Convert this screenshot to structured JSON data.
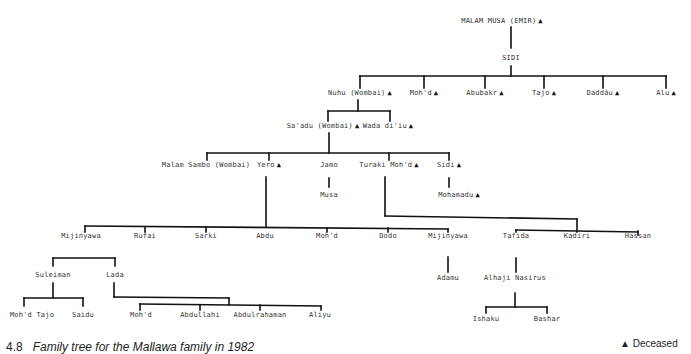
{
  "title": "Family tree for the Mallawa family in 1982",
  "figure_number": "4.8",
  "legend": {
    "symbol": "▲",
    "label": "Deceased"
  },
  "nodes": [
    {
      "id": "malam_musa",
      "name": "MALAM MUSA (EMIR)",
      "deceased": true,
      "x": 502,
      "y": 22
    },
    {
      "id": "sidi_root",
      "name": "SIDI",
      "deceased": false,
      "x": 511,
      "y": 59
    },
    {
      "id": "nuhu",
      "name": "Nuhu (Wombai)",
      "deceased": true,
      "x": 360,
      "y": 94
    },
    {
      "id": "mohd1",
      "name": "Moh'd",
      "deceased": true,
      "x": 424,
      "y": 94
    },
    {
      "id": "abubakr",
      "name": "Abubakr",
      "deceased": true,
      "x": 485,
      "y": 94
    },
    {
      "id": "tajo",
      "name": "Tajo",
      "deceased": true,
      "x": 544,
      "y": 94
    },
    {
      "id": "daddau",
      "name": "Daddâu",
      "deceased": true,
      "x": 603,
      "y": 94
    },
    {
      "id": "alu",
      "name": "Alu",
      "deceased": true,
      "x": 666,
      "y": 94
    },
    {
      "id": "saadu",
      "name": "Sa'adu (Wombai)",
      "deceased": true,
      "x": 323,
      "y": 127
    },
    {
      "id": "wada",
      "name": "Wada di'iu",
      "deceased": true,
      "x": 388,
      "y": 127
    },
    {
      "id": "malam_sambo",
      "name": "Malam Sambo (Wombai)",
      "deceased": false,
      "x": 206,
      "y": 166
    },
    {
      "id": "yero",
      "name": "Yero",
      "deceased": true,
      "x": 269,
      "y": 166
    },
    {
      "id": "jamo",
      "name": "Jamo",
      "deceased": false,
      "x": 329,
      "y": 166
    },
    {
      "id": "turaki",
      "name": "Turaki Moh'd",
      "deceased": true,
      "x": 389,
      "y": 166
    },
    {
      "id": "sidi2",
      "name": "Sidi",
      "deceased": true,
      "x": 449,
      "y": 166
    },
    {
      "id": "musa",
      "name": "Musa",
      "deceased": false,
      "x": 329,
      "y": 196
    },
    {
      "id": "mohamadu",
      "name": "Mohamadu",
      "deceased": true,
      "x": 459,
      "y": 196
    },
    {
      "id": "mijinyawa1",
      "name": "Mijinyawa",
      "deceased": false,
      "x": 81,
      "y": 237
    },
    {
      "id": "rufai",
      "name": "Rufai",
      "deceased": false,
      "x": 145,
      "y": 237
    },
    {
      "id": "sarki",
      "name": "Sarki",
      "deceased": false,
      "x": 206,
      "y": 237
    },
    {
      "id": "abdu",
      "name": "Abdu",
      "deceased": false,
      "x": 265,
      "y": 237
    },
    {
      "id": "mohd2",
      "name": "Moh'd",
      "deceased": false,
      "x": 327,
      "y": 237
    },
    {
      "id": "dodo",
      "name": "Dodo",
      "deceased": false,
      "x": 388,
      "y": 237
    },
    {
      "id": "mijinyawa2",
      "name": "Mijinyawa",
      "deceased": false,
      "x": 448,
      "y": 237
    },
    {
      "id": "tafida",
      "name": "Tafida",
      "deceased": false,
      "x": 516,
      "y": 237
    },
    {
      "id": "kadiri",
      "name": "Kadiri",
      "deceased": false,
      "x": 577,
      "y": 237
    },
    {
      "id": "hassan",
      "name": "Hassan",
      "deceased": false,
      "x": 638,
      "y": 237
    },
    {
      "id": "suleiman",
      "name": "Suleiman",
      "deceased": false,
      "x": 53,
      "y": 276
    },
    {
      "id": "lada",
      "name": "Lada",
      "deceased": false,
      "x": 115,
      "y": 276
    },
    {
      "id": "adamu",
      "name": "Adamu",
      "deceased": false,
      "x": 448,
      "y": 279
    },
    {
      "id": "alhaji_nasirus",
      "name": "Alhaji Nasirus",
      "deceased": false,
      "x": 515,
      "y": 279
    },
    {
      "id": "mohd_tajo",
      "name": "Moh'd Tajo",
      "deceased": false,
      "x": 32,
      "y": 316
    },
    {
      "id": "saidu",
      "name": "Saidu",
      "deceased": false,
      "x": 83,
      "y": 316
    },
    {
      "id": "mohd3",
      "name": "Moh'd",
      "deceased": false,
      "x": 141,
      "y": 316
    },
    {
      "id": "abdullahi",
      "name": "Abdullahi",
      "deceased": false,
      "x": 200,
      "y": 316
    },
    {
      "id": "abdulrahaman",
      "name": "Abdulrahaman",
      "deceased": false,
      "x": 260,
      "y": 316
    },
    {
      "id": "aliyu",
      "name": "Aliyu",
      "deceased": false,
      "x": 320,
      "y": 316
    },
    {
      "id": "ishaku",
      "name": "Ishaku",
      "deceased": false,
      "x": 486,
      "y": 320
    },
    {
      "id": "bashar",
      "name": "Bashar",
      "deceased": false,
      "x": 547,
      "y": 320
    }
  ],
  "lines": [
    [
      511,
      27,
      511,
      48
    ],
    [
      511,
      66,
      511,
      76
    ],
    [
      360,
      76,
      666,
      76
    ],
    [
      360,
      76,
      360,
      88
    ],
    [
      424,
      76,
      424,
      88
    ],
    [
      485,
      76,
      485,
      88
    ],
    [
      544,
      76,
      544,
      88
    ],
    [
      603,
      76,
      603,
      88
    ],
    [
      666,
      76,
      666,
      88
    ],
    [
      358,
      100,
      358,
      111
    ],
    [
      328,
      111,
      390,
      111
    ],
    [
      328,
      111,
      328,
      121
    ],
    [
      390,
      111,
      390,
      121
    ],
    [
      329,
      133,
      329,
      153
    ],
    [
      207,
      153,
      449,
      153
    ],
    [
      207,
      153,
      207,
      160
    ],
    [
      269,
      153,
      269,
      160
    ],
    [
      389,
      153,
      389,
      160
    ],
    [
      449,
      153,
      449,
      160
    ],
    [
      329,
      178,
      329,
      187
    ],
    [
      449,
      178,
      449,
      187
    ],
    [
      266,
      177,
      266,
      227
    ],
    [
      85,
      226,
      448,
      229
    ],
    [
      85,
      226,
      85,
      232
    ],
    [
      145,
      227,
      145,
      232
    ],
    [
      206,
      227,
      206,
      232
    ],
    [
      327,
      228,
      327,
      232
    ],
    [
      388,
      228,
      388,
      232
    ],
    [
      448,
      229,
      448,
      232
    ],
    [
      385,
      177,
      385,
      216
    ],
    [
      385,
      216,
      577,
      219
    ],
    [
      577,
      219,
      577,
      232
    ],
    [
      516,
      230,
      638,
      232
    ],
    [
      516,
      230,
      516,
      232
    ],
    [
      638,
      231,
      638,
      235
    ],
    [
      448,
      257,
      448,
      272
    ],
    [
      516,
      258,
      516,
      272
    ],
    [
      53,
      258,
      115,
      258
    ],
    [
      53,
      258,
      53,
      266
    ],
    [
      115,
      258,
      115,
      266
    ],
    [
      53,
      283,
      53,
      298
    ],
    [
      24,
      298,
      83,
      298
    ],
    [
      24,
      298,
      24,
      306
    ],
    [
      83,
      298,
      83,
      306
    ],
    [
      114,
      283,
      114,
      297
    ],
    [
      114,
      297,
      229,
      298
    ],
    [
      229,
      298,
      229,
      305
    ],
    [
      140,
      304,
      321,
      306
    ],
    [
      140,
      304,
      140,
      310
    ],
    [
      200,
      305,
      200,
      310
    ],
    [
      260,
      305,
      260,
      310
    ],
    [
      321,
      306,
      321,
      310
    ],
    [
      515,
      293,
      515,
      307
    ],
    [
      486,
      307,
      547,
      307
    ],
    [
      486,
      307,
      486,
      313
    ],
    [
      547,
      307,
      547,
      313
    ]
  ]
}
